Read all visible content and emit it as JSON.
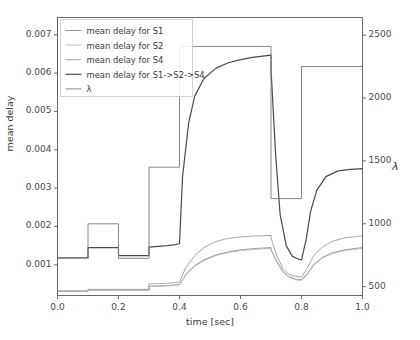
{
  "chart_data": {
    "type": "line",
    "title": "",
    "xlabel": "time [sec]",
    "ylabel": "mean delay",
    "y2label": "λ",
    "xlim": [
      0.0,
      1.0
    ],
    "ylim": [
      0.0002,
      0.00745
    ],
    "y2lim": [
      430,
      2640
    ],
    "grid": false,
    "legend_position": "upper left",
    "xticks": [
      "0.0",
      "0.2",
      "0.4",
      "0.6",
      "0.8",
      "1.0"
    ],
    "xtick_values": [
      0.0,
      0.2,
      0.4,
      0.6,
      0.8,
      1.0
    ],
    "yticks": [
      "0.001",
      "0.002",
      "0.003",
      "0.004",
      "0.005",
      "0.006",
      "0.007"
    ],
    "ytick_values": [
      0.001,
      0.002,
      0.003,
      0.004,
      0.005,
      0.006,
      0.007
    ],
    "y2ticks": [
      "500",
      "1000",
      "1500",
      "2000",
      "2500"
    ],
    "y2tick_values": [
      500,
      1000,
      1500,
      2000,
      2500
    ],
    "series": [
      {
        "name": "mean delay for S1",
        "axis": "left",
        "color": "#8d8d8d",
        "width": 0.9,
        "x": [
          0.0,
          0.05,
          0.1,
          0.1,
          0.18,
          0.2,
          0.2,
          0.28,
          0.3,
          0.3,
          0.36,
          0.38,
          0.4,
          0.42,
          0.45,
          0.48,
          0.52,
          0.56,
          0.6,
          0.64,
          0.68,
          0.7,
          0.7,
          0.72,
          0.74,
          0.76,
          0.78,
          0.8,
          0.8,
          0.82,
          0.84,
          0.87,
          0.9,
          0.94,
          1.0
        ],
        "y": [
          0.00031,
          0.00031,
          0.00031,
          0.00034,
          0.00034,
          0.00034,
          0.00034,
          0.00034,
          0.00034,
          0.00044,
          0.00046,
          0.00047,
          0.00049,
          0.00074,
          0.00098,
          0.00113,
          0.00126,
          0.00134,
          0.00139,
          0.00142,
          0.00144,
          0.00145,
          0.0014,
          0.00108,
          0.00082,
          0.00069,
          0.00063,
          0.00061,
          0.00061,
          0.00078,
          0.00101,
          0.0012,
          0.00131,
          0.00139,
          0.00145
        ]
      },
      {
        "name": "mean delay for S2",
        "axis": "left",
        "color": "#b9b9b9",
        "width": 0.9,
        "x": [
          0.0,
          0.05,
          0.1,
          0.1,
          0.18,
          0.2,
          0.2,
          0.28,
          0.3,
          0.3,
          0.36,
          0.38,
          0.4,
          0.42,
          0.45,
          0.48,
          0.52,
          0.56,
          0.6,
          0.64,
          0.68,
          0.7,
          0.7,
          0.72,
          0.74,
          0.76,
          0.78,
          0.8,
          0.8,
          0.82,
          0.84,
          0.87,
          0.9,
          0.94,
          1.0
        ],
        "y": [
          0.0003,
          0.0003,
          0.0003,
          0.00033,
          0.00033,
          0.00033,
          0.00033,
          0.00033,
          0.00033,
          0.00043,
          0.00045,
          0.00046,
          0.00048,
          0.00072,
          0.00096,
          0.00111,
          0.00124,
          0.00132,
          0.00137,
          0.0014,
          0.00142,
          0.00143,
          0.00138,
          0.00106,
          0.0008,
          0.00067,
          0.00061,
          0.00059,
          0.00059,
          0.00076,
          0.00099,
          0.00118,
          0.00129,
          0.00137,
          0.00143
        ]
      },
      {
        "name": "mean delay for S4",
        "axis": "left",
        "color": "#9d9d9d",
        "width": 0.9,
        "x": [
          0.0,
          0.05,
          0.1,
          0.1,
          0.18,
          0.2,
          0.2,
          0.28,
          0.3,
          0.3,
          0.36,
          0.38,
          0.4,
          0.42,
          0.45,
          0.48,
          0.52,
          0.56,
          0.6,
          0.64,
          0.68,
          0.7,
          0.7,
          0.72,
          0.74,
          0.76,
          0.78,
          0.8,
          0.8,
          0.82,
          0.84,
          0.87,
          0.9,
          0.94,
          1.0
        ],
        "y": [
          0.00032,
          0.00032,
          0.00032,
          0.00036,
          0.00036,
          0.00036,
          0.00036,
          0.00036,
          0.00036,
          0.0005,
          0.00052,
          0.00053,
          0.00055,
          0.00092,
          0.00124,
          0.00145,
          0.00161,
          0.00169,
          0.00173,
          0.00175,
          0.00176,
          0.00177,
          0.0017,
          0.00122,
          0.00089,
          0.00075,
          0.0007,
          0.00068,
          0.00068,
          0.00093,
          0.00124,
          0.00147,
          0.00161,
          0.0017,
          0.00176
        ]
      },
      {
        "name": "mean delay for S1->S2->S4",
        "axis": "left",
        "color": "#4a4a4a",
        "width": 1.2,
        "x": [
          0.0,
          0.05,
          0.1,
          0.1,
          0.18,
          0.2,
          0.2,
          0.28,
          0.3,
          0.3,
          0.36,
          0.38,
          0.4,
          0.41,
          0.43,
          0.45,
          0.48,
          0.52,
          0.56,
          0.6,
          0.64,
          0.68,
          0.7,
          0.7,
          0.715,
          0.73,
          0.75,
          0.77,
          0.79,
          0.8,
          0.8,
          0.815,
          0.83,
          0.85,
          0.88,
          0.92,
          0.96,
          1.0
        ],
        "y": [
          0.00118,
          0.00118,
          0.00118,
          0.00145,
          0.00145,
          0.00145,
          0.00124,
          0.00124,
          0.00124,
          0.00146,
          0.0015,
          0.00152,
          0.00155,
          0.0033,
          0.0047,
          0.0054,
          0.00586,
          0.00613,
          0.00627,
          0.00635,
          0.00641,
          0.00645,
          0.00647,
          0.0061,
          0.0039,
          0.0023,
          0.0015,
          0.00122,
          0.00115,
          0.00113,
          0.00113,
          0.00165,
          0.0024,
          0.00294,
          0.0033,
          0.00345,
          0.00349,
          0.00351
        ]
      },
      {
        "name": "λ",
        "axis": "right",
        "color": "#7a7a7a",
        "width": 0.9,
        "step": true,
        "x": [
          0.0,
          0.1,
          0.1,
          0.2,
          0.2,
          0.3,
          0.3,
          0.4,
          0.4,
          0.7,
          0.7,
          0.8,
          0.8,
          1.0
        ],
        "y": [
          730,
          730,
          1000,
          1000,
          725,
          725,
          1450,
          1450,
          2410,
          2410,
          1200,
          1200,
          2250,
          2250
        ]
      }
    ],
    "legend_entries": [
      "mean delay for S1",
      "mean delay for S2",
      "mean delay for S4",
      "mean delay for S1->S2->S4",
      "λ"
    ]
  },
  "axes": {
    "frame_color": "#5a5a5a",
    "background": "#ffffff"
  }
}
